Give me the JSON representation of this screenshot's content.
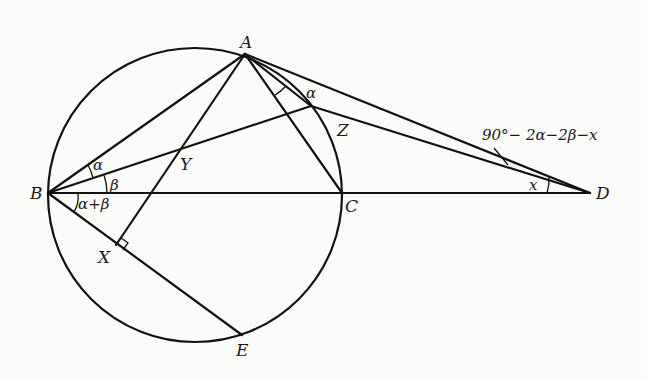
{
  "diagram": {
    "type": "geometry",
    "points": {
      "A": {
        "label": "A",
        "x": 245,
        "y": 54
      },
      "B": {
        "label": "B",
        "x": 48,
        "y": 193
      },
      "C": {
        "label": "C",
        "x": 342,
        "y": 193
      },
      "D": {
        "label": "D",
        "x": 590,
        "y": 193
      },
      "E": {
        "label": "E",
        "x": 242,
        "y": 335
      },
      "X": {
        "label": "X",
        "x": 116,
        "y": 245
      },
      "Y": {
        "label": "Y",
        "x": 180,
        "y": 151
      },
      "Z": {
        "label": "Z",
        "x": 311,
        "y": 106
      }
    },
    "circle": {
      "cx": 195,
      "cy": 195,
      "r": 147
    },
    "segments": [
      "AB",
      "AC",
      "AD",
      "AX",
      "BD",
      "BE",
      "BZ",
      "ZD"
    ],
    "angle_labels": {
      "alpha_at_B": "α",
      "beta_at_B": "β",
      "alpha_plus_beta": "α+β",
      "alpha_at_A": "α",
      "x_at_D": "x",
      "callout": "90°− 2α−2β−x"
    },
    "right_angle_at": "X"
  }
}
